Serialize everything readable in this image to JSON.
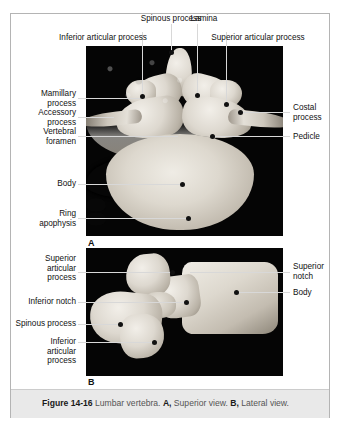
{
  "figure": {
    "caption": {
      "figure_number": "Figure 14-16",
      "subject": "Lumbar vertebra.",
      "part_a_letter": "A,",
      "part_a_text": "Superior view.",
      "part_b_letter": "B,",
      "part_b_text": "Lateral view."
    },
    "panels": [
      {
        "letter": "A",
        "view": "Superior view",
        "labels": [
          {
            "id": "inferior-articular-process",
            "text": "Inferior articular process",
            "side": "top"
          },
          {
            "id": "spinous-process",
            "text": "Spinous process",
            "side": "top"
          },
          {
            "id": "lamina",
            "text": "Lamina",
            "side": "top"
          },
          {
            "id": "superior-articular-process",
            "text": "Superior articular process",
            "side": "top"
          },
          {
            "id": "mamillary-process",
            "text": "Mamillary\nprocess",
            "side": "left"
          },
          {
            "id": "accessory-process",
            "text": "Accessory\nprocess",
            "side": "left"
          },
          {
            "id": "vertebral-foramen",
            "text": "Vertebral\nforamen",
            "side": "left"
          },
          {
            "id": "body",
            "text": "Body",
            "side": "left"
          },
          {
            "id": "ring-apophysis",
            "text": "Ring\napophysis",
            "side": "left"
          },
          {
            "id": "costal-process",
            "text": "Costal\nprocess",
            "side": "right"
          },
          {
            "id": "pedicle",
            "text": "Pedicle",
            "side": "right"
          }
        ]
      },
      {
        "letter": "B",
        "view": "Lateral view",
        "labels": [
          {
            "id": "superior-articular-process",
            "text": "Superior\narticular\nprocess",
            "side": "left"
          },
          {
            "id": "inferior-notch",
            "text": "Inferior notch",
            "side": "left"
          },
          {
            "id": "spinous-process",
            "text": "Spinous process",
            "side": "left"
          },
          {
            "id": "inferior-articular-process",
            "text": "Inferior\narticular\nprocess",
            "side": "left"
          },
          {
            "id": "superior-notch",
            "text": "Superior\nnotch",
            "side": "right"
          },
          {
            "id": "body",
            "text": "Body",
            "side": "right"
          }
        ]
      }
    ],
    "colors": {
      "page_background": "#ffffff",
      "frame_border": "#b4b4b4",
      "plate_background": "#050505",
      "leader_line": "#d8d8d8",
      "dot": "#111111",
      "caption_bar": "#e9e9e9",
      "text": "#111111"
    }
  }
}
